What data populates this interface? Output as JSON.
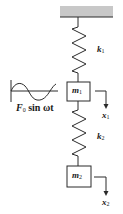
{
  "diagram": {
    "colors": {
      "stroke": "#2a2a2a",
      "ceiling_fill": "#c8c8c8",
      "background": "#ffffff"
    },
    "ceiling": {
      "label": "fixed support"
    },
    "springs": [
      {
        "id": "k1",
        "symbol": "k",
        "subscript": "1"
      },
      {
        "id": "k2",
        "symbol": "k",
        "subscript": "2"
      }
    ],
    "masses": [
      {
        "id": "m1",
        "symbol": "m",
        "subscript": "1"
      },
      {
        "id": "m2",
        "symbol": "m",
        "subscript": "2"
      }
    ],
    "displacements": [
      {
        "id": "x1",
        "symbol": "x",
        "subscript": "1"
      },
      {
        "id": "x2",
        "symbol": "x",
        "subscript": "2"
      }
    ],
    "forcing": {
      "symbol": "F",
      "subscript": "0",
      "expression": "sin ωt",
      "waveform": "sine-wave"
    }
  }
}
